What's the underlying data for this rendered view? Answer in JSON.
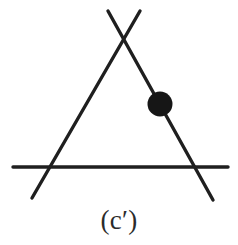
{
  "figure": {
    "caption": "(c′)",
    "caption_plain": "(c')",
    "background_color": "#ffffff",
    "ink_color": "#1f1f1f",
    "stroke_width": 3.4,
    "blob_color": "#161616",
    "canvas": {
      "width": 238,
      "height": 245
    }
  },
  "chart_data": {
    "type": "diagram",
    "title": "(c′)",
    "xlabel": "",
    "ylabel": "",
    "xlim": [
      0,
      238
    ],
    "ylim": [
      245,
      0
    ],
    "grid": false,
    "legend": false,
    "elements": [
      {
        "name": "left-descending-line",
        "kind": "line-segment",
        "x1": 140,
        "y1": 11,
        "x2": 32,
        "y2": 198,
        "color": "#1f1f1f",
        "width": 3.4
      },
      {
        "name": "right-descending-line",
        "kind": "line-segment",
        "x1": 108,
        "y1": 11,
        "x2": 213,
        "y2": 200,
        "color": "#1f1f1f",
        "width": 3.4
      },
      {
        "name": "horizontal-base-line",
        "kind": "line-segment",
        "x1": 13,
        "y1": 167,
        "x2": 228,
        "y2": 167,
        "color": "#1f1f1f",
        "width": 3.4
      },
      {
        "name": "vertex-node",
        "kind": "filled-circle",
        "cx": 160,
        "cy": 104,
        "r": 12.5,
        "color": "#161616"
      }
    ],
    "intersections": [
      {
        "name": "apex-crossing",
        "x": 125,
        "y": 40
      },
      {
        "name": "left-base-crossing",
        "x": 52,
        "y": 167
      },
      {
        "name": "right-base-crossing",
        "x": 196,
        "y": 167
      }
    ],
    "annotations": [
      {
        "name": "figure-label",
        "text": "(c′)",
        "x": 119,
        "y": 222
      }
    ]
  }
}
